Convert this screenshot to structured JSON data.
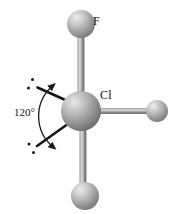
{
  "figure": {
    "type": "molecular-geometry-diagram",
    "background_color": "#ffffff",
    "width": 174,
    "height": 214
  },
  "molecule": {
    "central_atom": {
      "label": "Cl",
      "label_x": 100,
      "label_y": 89,
      "cx": 81,
      "cy": 111,
      "r": 20,
      "color": "#9e9e9e"
    },
    "ligands": [
      {
        "name": "fluorine-top",
        "label": "F",
        "label_x": 93,
        "label_y": 15,
        "cx": 81,
        "cy": 24,
        "r": 14,
        "color": "#b0b0b0"
      },
      {
        "name": "ligand-right",
        "label": "",
        "cx": 157,
        "cy": 111,
        "r": 11,
        "color": "#a8a8a8"
      },
      {
        "name": "ligand-bottom",
        "label": "",
        "cx": 85,
        "cy": 196,
        "r": 14,
        "color": "#a8a8a8"
      }
    ],
    "bonds": [
      {
        "name": "bond-center-to-top",
        "x1": 81,
        "y1": 111,
        "x2": 81,
        "y2": 24,
        "width": 7
      },
      {
        "name": "bond-center-to-right",
        "x1": 81,
        "y1": 111,
        "x2": 157,
        "y2": 111,
        "width": 6
      },
      {
        "name": "bond-center-to-bottom",
        "x1": 81,
        "y1": 111,
        "x2": 85,
        "y2": 196,
        "width": 7
      }
    ],
    "lone_pairs": [
      {
        "name": "lone-pair-upper-left",
        "x1": 70,
        "y1": 104,
        "x2": 38,
        "y2": 88,
        "dots": [
          {
            "cx": 32,
            "cy": 80
          },
          {
            "cx": 28,
            "cy": 88
          }
        ]
      },
      {
        "name": "lone-pair-lower-left",
        "x1": 70,
        "y1": 120,
        "x2": 38,
        "y2": 145,
        "dots": [
          {
            "cx": 29,
            "cy": 144
          },
          {
            "cx": 33,
            "cy": 152
          }
        ]
      }
    ]
  },
  "annotations": {
    "angle": {
      "label": "120°",
      "label_x": 14,
      "label_y": 107,
      "arc_color": "#1a1a1a",
      "arc": {
        "start_x": 50,
        "start_y": 85,
        "end_x": 50,
        "end_y": 148,
        "radius": 42
      }
    }
  },
  "colors": {
    "sphere_light": "#dcdcdc",
    "sphere_mid": "#9a9a9a",
    "sphere_dark": "#5e5e5e",
    "bond_light": "#cfcfcf",
    "bond_mid": "#8f8f8f",
    "bond_dark": "#5a5a5a",
    "ink": "#101010"
  }
}
